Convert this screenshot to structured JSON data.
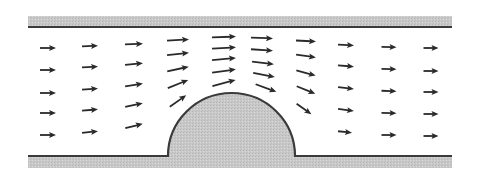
{
  "diagram": {
    "title": "",
    "colors": {
      "background": "#ffffff",
      "wall_fill": "#c9c9c9",
      "wall_line": "#3a3a3a",
      "arrow": "#2a2a2a"
    },
    "channel": {
      "x_start": 28,
      "x_end": 452,
      "top_band": {
        "y": 16,
        "height": 11
      },
      "top_line_y": 27,
      "bottom_line_y": 156,
      "bottom_band": {
        "y": 157,
        "height": 11
      }
    },
    "bump": {
      "left_x": 168,
      "right_x": 295,
      "base_y": 156,
      "top_y": 93
    },
    "arrows": [
      {
        "x": 48,
        "y": 48,
        "len": 16,
        "angle": 0
      },
      {
        "x": 48,
        "y": 70,
        "len": 16,
        "angle": 0
      },
      {
        "x": 48,
        "y": 93,
        "len": 16,
        "angle": 0
      },
      {
        "x": 48,
        "y": 113,
        "len": 16,
        "angle": 0
      },
      {
        "x": 48,
        "y": 135,
        "len": 16,
        "angle": 0
      },
      {
        "x": 90,
        "y": 46,
        "len": 16,
        "angle": -2
      },
      {
        "x": 90,
        "y": 67,
        "len": 16,
        "angle": -3
      },
      {
        "x": 90,
        "y": 89,
        "len": 16,
        "angle": -4
      },
      {
        "x": 90,
        "y": 110,
        "len": 16,
        "angle": -5
      },
      {
        "x": 90,
        "y": 132,
        "len": 16,
        "angle": -6
      },
      {
        "x": 134,
        "y": 44,
        "len": 18,
        "angle": -2
      },
      {
        "x": 134,
        "y": 64,
        "len": 18,
        "angle": -5
      },
      {
        "x": 134,
        "y": 85,
        "len": 18,
        "angle": -9
      },
      {
        "x": 134,
        "y": 105,
        "len": 18,
        "angle": -12
      },
      {
        "x": 134,
        "y": 126,
        "len": 18,
        "angle": -14
      },
      {
        "x": 178,
        "y": 40,
        "len": 22,
        "angle": -3
      },
      {
        "x": 178,
        "y": 54,
        "len": 22,
        "angle": -6
      },
      {
        "x": 178,
        "y": 69,
        "len": 22,
        "angle": -12
      },
      {
        "x": 178,
        "y": 84,
        "len": 22,
        "angle": -22
      },
      {
        "x": 178,
        "y": 101,
        "len": 20,
        "angle": -35
      },
      {
        "x": 224,
        "y": 37,
        "len": 24,
        "angle": -2
      },
      {
        "x": 224,
        "y": 48,
        "len": 24,
        "angle": -3
      },
      {
        "x": 224,
        "y": 59,
        "len": 24,
        "angle": -5
      },
      {
        "x": 224,
        "y": 71,
        "len": 24,
        "angle": -8
      },
      {
        "x": 224,
        "y": 83,
        "len": 24,
        "angle": -15
      },
      {
        "x": 262,
        "y": 38,
        "len": 22,
        "angle": 2
      },
      {
        "x": 262,
        "y": 50,
        "len": 22,
        "angle": 4
      },
      {
        "x": 263,
        "y": 63,
        "len": 22,
        "angle": 7
      },
      {
        "x": 264,
        "y": 75,
        "len": 22,
        "angle": 11
      },
      {
        "x": 266,
        "y": 88,
        "len": 22,
        "angle": 20
      },
      {
        "x": 306,
        "y": 41,
        "len": 20,
        "angle": 3
      },
      {
        "x": 306,
        "y": 56,
        "len": 20,
        "angle": 8
      },
      {
        "x": 306,
        "y": 73,
        "len": 20,
        "angle": 15
      },
      {
        "x": 306,
        "y": 90,
        "len": 20,
        "angle": 22
      },
      {
        "x": 304,
        "y": 109,
        "len": 18,
        "angle": 35
      },
      {
        "x": 346,
        "y": 45,
        "len": 16,
        "angle": 3
      },
      {
        "x": 346,
        "y": 66,
        "len": 16,
        "angle": 5
      },
      {
        "x": 346,
        "y": 88,
        "len": 16,
        "angle": 7
      },
      {
        "x": 346,
        "y": 110,
        "len": 16,
        "angle": 8
      },
      {
        "x": 345,
        "y": 132,
        "len": 14,
        "angle": 6
      },
      {
        "x": 389,
        "y": 47,
        "len": 15,
        "angle": 1
      },
      {
        "x": 389,
        "y": 69,
        "len": 15,
        "angle": 1
      },
      {
        "x": 389,
        "y": 91,
        "len": 15,
        "angle": 2
      },
      {
        "x": 389,
        "y": 113,
        "len": 15,
        "angle": 1
      },
      {
        "x": 389,
        "y": 135,
        "len": 15,
        "angle": 0
      },
      {
        "x": 431,
        "y": 48,
        "len": 15,
        "angle": 0
      },
      {
        "x": 431,
        "y": 71,
        "len": 15,
        "angle": 0
      },
      {
        "x": 431,
        "y": 92,
        "len": 15,
        "angle": 0
      },
      {
        "x": 431,
        "y": 114,
        "len": 15,
        "angle": 0
      },
      {
        "x": 431,
        "y": 136,
        "len": 15,
        "angle": 0
      }
    ]
  }
}
